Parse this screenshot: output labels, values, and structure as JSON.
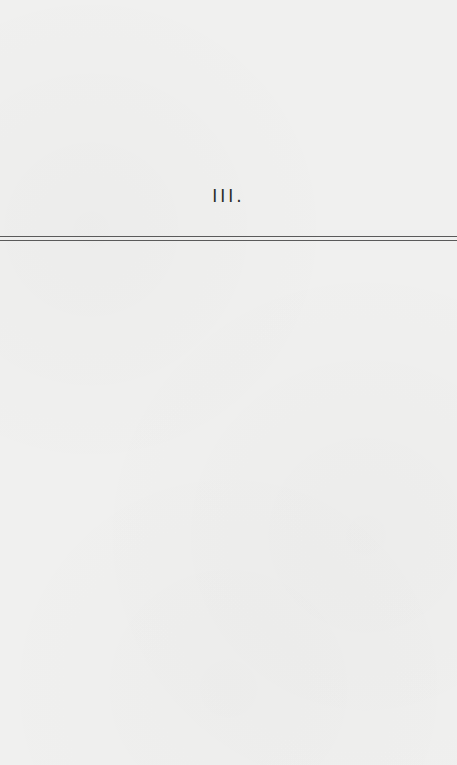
{
  "page": {
    "section_heading": "III.",
    "rule_style": "double",
    "background_color": "#f0f0ef",
    "text_color": "#2a2a2a",
    "rule_color": "#5a5a5a"
  }
}
